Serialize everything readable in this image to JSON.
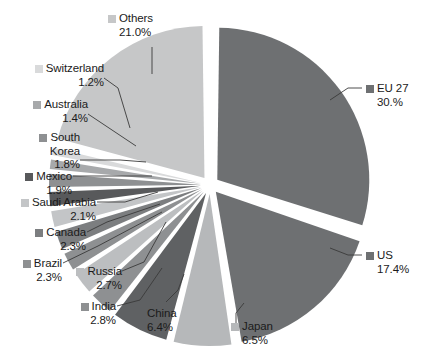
{
  "chart_data": {
    "type": "pie",
    "title": "",
    "subtitle": "",
    "xlabel": "",
    "ylabel": "",
    "legend_position": "callout-labels",
    "grid": false,
    "exploded": true,
    "units": "percent",
    "start_angle_deg": 0,
    "direction": "clockwise",
    "categories": [
      "EU 27",
      "US",
      "Japan",
      "China",
      "India",
      "Russia",
      "Brazil",
      "Canada",
      "Saudi Arabia",
      "Mexico",
      "South Korea",
      "Australia",
      "Switzerland",
      "Others"
    ],
    "values": [
      30.0,
      17.4,
      6.5,
      6.4,
      2.8,
      2.7,
      2.3,
      2.3,
      2.1,
      1.9,
      1.8,
      1.4,
      1.2,
      21.0
    ],
    "slices": [
      {
        "name": "EU 27",
        "value": 30.0,
        "value_label": "30.%",
        "color": "#6e7072"
      },
      {
        "name": "US",
        "value": 17.4,
        "value_label": "17.4%",
        "color": "#6e7072"
      },
      {
        "name": "Japan",
        "value": 6.5,
        "value_label": "6.5%",
        "color": "#b6b8ba"
      },
      {
        "name": "China",
        "value": 6.4,
        "value_label": "6.4%",
        "color": "#5f6163"
      },
      {
        "name": "India",
        "value": 2.8,
        "value_label": "2.8%",
        "color": "#8e9092"
      },
      {
        "name": "Russia",
        "value": 2.7,
        "value_label": "2.7%",
        "color": "#bcbec0"
      },
      {
        "name": "Brazil",
        "value": 2.3,
        "value_label": "2.3%",
        "color": "#8e9092"
      },
      {
        "name": "Canada",
        "value": 2.3,
        "value_label": "2.3%",
        "color": "#7c7e80"
      },
      {
        "name": "Saudi Arabia",
        "value": 2.1,
        "value_label": "2.1%",
        "color": "#c3c5c7"
      },
      {
        "name": "Mexico",
        "value": 1.9,
        "value_label": "1.9%",
        "color": "#58595b"
      },
      {
        "name": "South Korea",
        "value": 1.8,
        "value_label": "1.8%",
        "color": "#8e9092"
      },
      {
        "name": "Australia",
        "value": 1.4,
        "value_label": "1.4%",
        "color": "#a7a9ab"
      },
      {
        "name": "Switzerland",
        "value": 1.2,
        "value_label": "1.2%",
        "color": "#d9dadb"
      },
      {
        "name": "Others",
        "value": 21.0,
        "value_label": "21.0%",
        "color": "#c6c7c8"
      }
    ]
  },
  "labels": {
    "others": {
      "name": "Others",
      "pct": "21.0%"
    },
    "switzerland": {
      "name": "Switzerland",
      "pct": "1.2%"
    },
    "australia": {
      "name": "Australia",
      "pct": "1.4%"
    },
    "south_korea": {
      "name": "South",
      "name2": "Korea",
      "pct": "1.8%"
    },
    "mexico": {
      "name": "Mexico",
      "pct": "1.9%"
    },
    "saudi_arabia": {
      "name": "Saudi Arabia",
      "pct": "2.1%"
    },
    "canada": {
      "name": "Canada",
      "pct": "2.3%"
    },
    "brazil": {
      "name": "Brazil",
      "pct": "2.3%"
    },
    "russia": {
      "name": "Russia",
      "pct": "2.7%"
    },
    "india": {
      "name": "India",
      "pct": "2.8%"
    },
    "china": {
      "name": "China",
      "pct": "6.4%"
    },
    "japan": {
      "name": "Japan",
      "pct": "6.5%"
    },
    "us": {
      "name": "US",
      "pct": "17.4%"
    },
    "eu27": {
      "name": "EU 27",
      "pct": "30.%"
    }
  }
}
